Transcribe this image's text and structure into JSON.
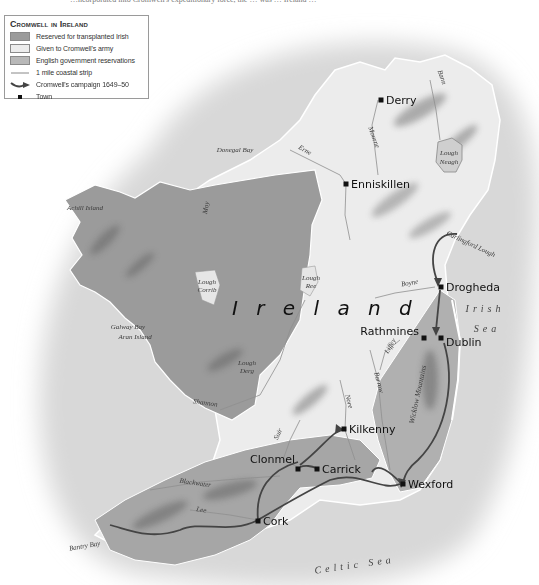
{
  "top_caption": "…ncorporated into Cromwell's expeditionary force, the … was … Ireland …",
  "legend": {
    "title": "Cromwell in Ireland",
    "items": [
      {
        "type": "swatch",
        "label": "Reserved for transplanted Irish",
        "color": "#9b9b9b"
      },
      {
        "type": "swatch",
        "label": "Given to Cromwell's army",
        "color": "#ececec"
      },
      {
        "type": "swatch",
        "label": "English government reservations",
        "color": "#b8b8b8"
      },
      {
        "type": "line",
        "label": "1 mile coastal strip",
        "color": "#888888"
      },
      {
        "type": "arrow",
        "label": "Cromwell's campaign 1649–50",
        "color": "#444444"
      },
      {
        "type": "square",
        "label": "Town",
        "color": "#111111"
      }
    ]
  },
  "map": {
    "country_label": "I r e l a n d",
    "colors": {
      "sea": "#d9d9d9",
      "army_land": "#ececec",
      "irish_reserved": "#9b9b9b",
      "english_reserved": "#b5b5b5",
      "campaign": "#444444",
      "coast": "#ffffff"
    },
    "towns": [
      {
        "name": "Derry",
        "x": 381,
        "y": 100
      },
      {
        "name": "Enniskillen",
        "x": 346,
        "y": 184
      },
      {
        "name": "Drogheda",
        "x": 441,
        "y": 287
      },
      {
        "name": "Rathmines",
        "x": 424,
        "y": 338
      },
      {
        "name": "Dublin",
        "x": 441,
        "y": 338
      },
      {
        "name": "Kilkenny",
        "x": 344,
        "y": 429
      },
      {
        "name": "Clonmel",
        "x": 298,
        "y": 469
      },
      {
        "name": "Carrick",
        "x": 317,
        "y": 469
      },
      {
        "name": "Wexford",
        "x": 403,
        "y": 484
      },
      {
        "name": "Cork",
        "x": 258,
        "y": 521
      }
    ],
    "water_labels": [
      {
        "name": "Donegal Bay",
        "x": 235,
        "y": 152,
        "rot": 0
      },
      {
        "name": "Erne",
        "x": 304,
        "y": 152,
        "rot": 30
      },
      {
        "name": "Bann",
        "x": 440,
        "y": 78,
        "rot": 70
      },
      {
        "name": "Mourne",
        "x": 372,
        "y": 138,
        "rot": 70
      },
      {
        "name": "Lough",
        "x": 449,
        "y": 155,
        "rot": 0
      },
      {
        "name": "Neagh",
        "x": 449,
        "y": 164,
        "rot": 0
      },
      {
        "name": "Carlingford Lough",
        "x": 470,
        "y": 246,
        "rot": 25
      },
      {
        "name": "Boyne",
        "x": 410,
        "y": 285,
        "rot": -10
      },
      {
        "name": "Moy",
        "x": 208,
        "y": 208,
        "rot": -80
      },
      {
        "name": "Lough",
        "x": 207,
        "y": 284,
        "rot": 0
      },
      {
        "name": "Corrib",
        "x": 207,
        "y": 292,
        "rot": 0
      },
      {
        "name": "Lough",
        "x": 311,
        "y": 280,
        "rot": 0
      },
      {
        "name": "Ree",
        "x": 311,
        "y": 288,
        "rot": 0
      },
      {
        "name": "Galway Bay",
        "x": 128,
        "y": 329,
        "rot": 0
      },
      {
        "name": "Lough",
        "x": 247,
        "y": 365,
        "rot": 0
      },
      {
        "name": "Derg",
        "x": 247,
        "y": 373,
        "rot": 0
      },
      {
        "name": "Shannon",
        "x": 205,
        "y": 405,
        "rot": 8
      },
      {
        "name": "Liffey",
        "x": 392,
        "y": 347,
        "rot": -60
      },
      {
        "name": "Barrow",
        "x": 377,
        "y": 383,
        "rot": 75
      },
      {
        "name": "Nore",
        "x": 347,
        "y": 402,
        "rot": 75
      },
      {
        "name": "Suir",
        "x": 280,
        "y": 435,
        "rot": -65
      },
      {
        "name": "Blackwater",
        "x": 195,
        "y": 485,
        "rot": 8
      },
      {
        "name": "Lee",
        "x": 201,
        "y": 512,
        "rot": 10
      },
      {
        "name": "Bantry Bay",
        "x": 85,
        "y": 548,
        "rot": -10
      }
    ],
    "island_labels": [
      {
        "name": "Achill Island",
        "x": 85,
        "y": 210
      },
      {
        "name": "Aran Island",
        "x": 135,
        "y": 339
      }
    ],
    "mountain_labels": [
      {
        "name": "Wicklow Mountains",
        "x": 420,
        "y": 395,
        "rot": -78
      }
    ],
    "sea_labels": [
      {
        "name": "Irish",
        "x": 485,
        "y": 312,
        "rot": 0
      },
      {
        "name": "Sea",
        "x": 487,
        "y": 332,
        "rot": 0
      },
      {
        "name": "Celtic Sea",
        "x": 355,
        "y": 568,
        "rot": -8
      }
    ]
  }
}
